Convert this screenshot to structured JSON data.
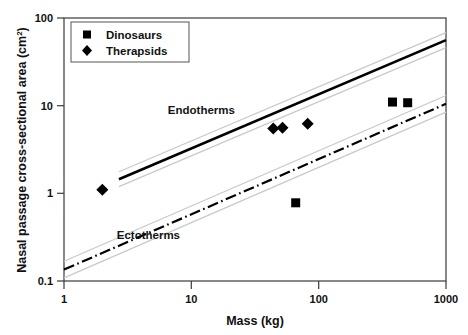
{
  "chart_data": {
    "type": "scatter",
    "title": "",
    "xlabel": "Mass (kg)",
    "ylabel": "Nasal passage cross-sectional area (cm",
    "ylabel_sup": "2",
    "ylabel_tail": ")",
    "xscale": "log",
    "yscale": "log",
    "xlim": [
      1,
      1000
    ],
    "ylim": [
      0.1,
      100
    ],
    "xticks": [
      "1",
      "10",
      "100",
      "1000"
    ],
    "xtick_values": [
      1,
      10,
      100,
      1000
    ],
    "yticks": [
      "0.1",
      "1",
      "10",
      "100"
    ],
    "ytick_values": [
      0.1,
      1,
      10,
      100
    ],
    "grid": false,
    "legend_position": "top-left",
    "legend": [
      {
        "label": "Dinosaurs",
        "marker": "square"
      },
      {
        "label": "Therapsids",
        "marker": "diamond"
      }
    ],
    "series": [
      {
        "name": "Therapsids",
        "marker": "diamond",
        "color": "#000000",
        "points": [
          {
            "x": 2.0,
            "y": 1.1
          },
          {
            "x": 44.0,
            "y": 5.5
          },
          {
            "x": 52.0,
            "y": 5.6
          },
          {
            "x": 82.0,
            "y": 6.2
          }
        ]
      },
      {
        "name": "Dinosaurs",
        "marker": "square",
        "color": "#000000",
        "points": [
          {
            "x": 66.0,
            "y": 0.78
          },
          {
            "x": 380.0,
            "y": 11.0
          },
          {
            "x": 500.0,
            "y": 10.8
          }
        ]
      }
    ],
    "regressions": [
      {
        "name": "Endotherms",
        "style": "solid",
        "label": "Endotherms",
        "label_x": 12.0,
        "label_y": 8.0,
        "x_start": 2.7,
        "y_start": 1.45,
        "x_end": 1000.0,
        "y_end": 56.0,
        "ci_offset_dex": 0.085
      },
      {
        "name": "Ectotherms",
        "style": "dash-dot",
        "label": "Ectotherms",
        "label_x": 4.6,
        "label_y": 0.3,
        "x_start": 1.0,
        "y_start": 0.135,
        "x_end": 1000.0,
        "y_end": 10.5,
        "ci_offset_dex": 0.095
      }
    ]
  }
}
